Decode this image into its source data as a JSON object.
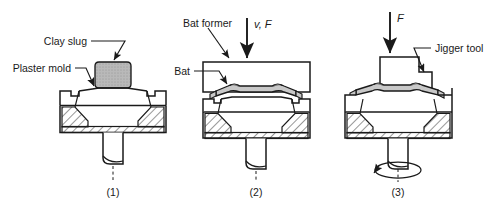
{
  "figure": {
    "type": "process-diagram",
    "step_count": 3,
    "colors": {
      "outline": "#1a1a1a",
      "clay_fill": "#b8b8b8",
      "bat_fill": "#c8c8c8",
      "mold_fill": "#ffffff",
      "hatch": "#1a1a1a",
      "background": "#ffffff"
    }
  },
  "panels": [
    {
      "caption": "(1)",
      "labels": {
        "clay_slug": "Clay slug",
        "plaster_mold": "Plaster mold"
      }
    },
    {
      "caption": "(2)",
      "labels": {
        "bat_former": "Bat former",
        "bat": "Bat",
        "force": "v, F"
      }
    },
    {
      "caption": "(3)",
      "labels": {
        "jigger_tool": "Jigger tool",
        "force": "F"
      }
    }
  ]
}
